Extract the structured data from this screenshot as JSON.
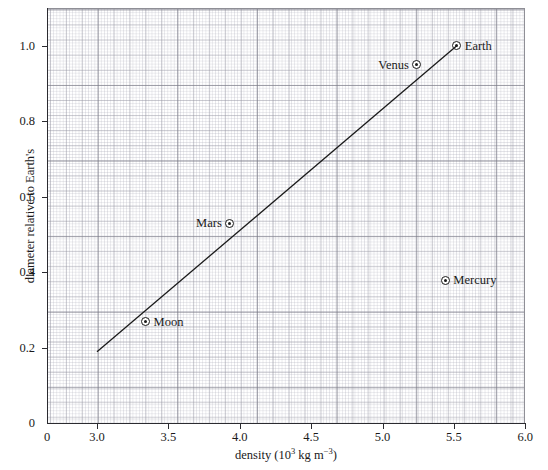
{
  "chart_data": {
    "type": "scatter",
    "title": "",
    "xlabel": "density (10^3 kg m^-3)",
    "xlabel_parts": {
      "text": "density (10",
      "sup1": "3",
      "mid": " kg m",
      "sup2": "−3",
      "tail": ")"
    },
    "ylabel": "diameter relative to Earth's",
    "xlim": [
      3.0,
      6.0
    ],
    "ylim": [
      0,
      1.1
    ],
    "x_axis_break": true,
    "x_origin_label": "0",
    "y_origin_label": "0",
    "grid": "graph-paper, fine 0.02 units, major 0.1 units, bold 0.5 units",
    "legend": "none",
    "x_ticks": [
      {
        "label": "3.0",
        "value": 3.0
      },
      {
        "label": "3.5",
        "value": 3.5
      },
      {
        "label": "4.0",
        "value": 4.0
      },
      {
        "label": "4.5",
        "value": 4.5
      },
      {
        "label": "5.0",
        "value": 5.0
      },
      {
        "label": "5.5",
        "value": 5.5
      },
      {
        "label": "6.0",
        "value": 6.0
      }
    ],
    "y_ticks": [
      {
        "label": "0.2",
        "value": 0.2
      },
      {
        "label": "0.4",
        "value": 0.4
      },
      {
        "label": "0.6",
        "value": 0.6
      },
      {
        "label": "0.8",
        "value": 0.8
      },
      {
        "label": "1.0",
        "value": 1.0
      }
    ],
    "points": [
      {
        "name": "Moon",
        "x": 3.34,
        "y": 0.27,
        "label_side": "right"
      },
      {
        "name": "Mars",
        "x": 3.93,
        "y": 0.53,
        "label_side": "left"
      },
      {
        "name": "Venus",
        "x": 5.24,
        "y": 0.95,
        "label_side": "left"
      },
      {
        "name": "Earth",
        "x": 5.52,
        "y": 1.0,
        "label_side": "right"
      },
      {
        "name": "Mercury",
        "x": 5.44,
        "y": 0.38,
        "label_side": "right"
      }
    ],
    "trend_line": {
      "name": "line of best fit",
      "x_start": 3.0,
      "y_start": 0.19,
      "x_end": 5.52,
      "y_end": 1.0,
      "color": "#1a1a1a"
    },
    "colors": {
      "axis": "#2b2b30",
      "grid_fine": "#afafbc",
      "grid_major": "#787884",
      "marker": "#1a1a1a",
      "background": "#ffffff"
    }
  }
}
